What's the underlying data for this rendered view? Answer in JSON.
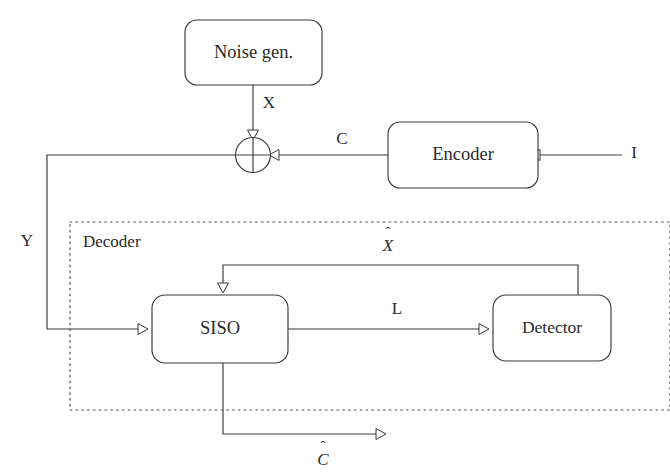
{
  "figure": {
    "kind": "block-diagram",
    "background_color": "#ffffff",
    "line_color": "#3a3a3a",
    "text_color": "#2a2a2a",
    "dotted_border_color": "#4a4a4a"
  },
  "blocks": {
    "noise_gen": {
      "label": "Noise gen."
    },
    "encoder": {
      "label": "Encoder"
    },
    "siso": {
      "label": "SISO"
    },
    "detector": {
      "label": "Detector"
    },
    "adder": {
      "label": ""
    }
  },
  "groups": {
    "decoder": {
      "label": "Decoder"
    }
  },
  "signals": {
    "x": {
      "label": "X"
    },
    "c": {
      "label": "C"
    },
    "i": {
      "label": "I"
    },
    "y": {
      "label": "Y"
    },
    "l": {
      "label": "L"
    },
    "x_hat": {
      "label": "X",
      "accent": "ˆ"
    },
    "c_hat": {
      "label": "C",
      "accent": "ˆ"
    }
  }
}
